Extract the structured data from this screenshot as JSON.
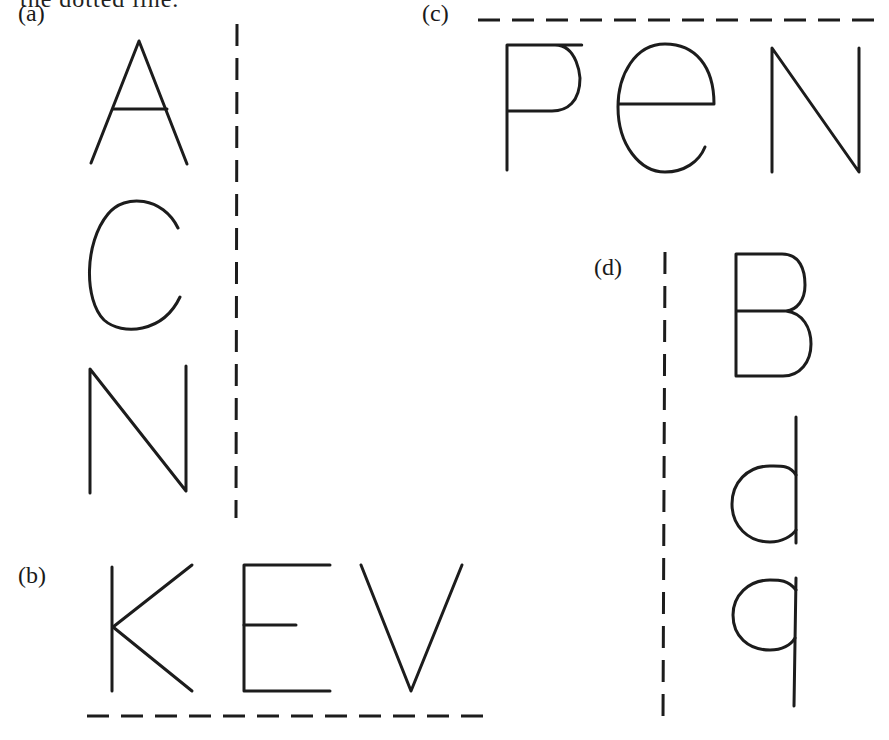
{
  "header": {
    "partial_text": "the dotted line."
  },
  "panels": [
    {
      "id": "a",
      "label": "(a)",
      "letters": [
        "A",
        "C",
        "N"
      ],
      "axis": "vertical dashed line to the right of the letters"
    },
    {
      "id": "b",
      "label": "(b)",
      "letters": [
        "K",
        "E",
        "V"
      ],
      "axis": "horizontal dashed line below the letters"
    },
    {
      "id": "c",
      "label": "(c)",
      "letters": [
        "P",
        "e",
        "N"
      ],
      "axis": "horizontal dashed line above the letters"
    },
    {
      "id": "d",
      "label": "(d)",
      "letters": [
        "B",
        "d",
        "q"
      ],
      "axis": "vertical dashed line to the left of the letters"
    }
  ],
  "colors": {
    "ink": "#1c1c1c",
    "background": "#ffffff"
  }
}
